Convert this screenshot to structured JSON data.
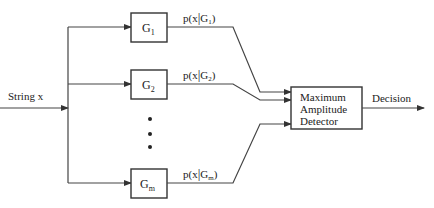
{
  "diagram": {
    "input_label": "String x",
    "output_label": "Decision",
    "detector": {
      "line1": "Maximum",
      "line2": "Amplitude",
      "line3": "Detector"
    },
    "classifiers": [
      {
        "name": "G",
        "sub": "1",
        "out_prefix": "p(x",
        "out_bar": "|",
        "out_name": "G",
        "out_sub": "1",
        "out_suffix": ")"
      },
      {
        "name": "G",
        "sub": "2",
        "out_prefix": "p(x",
        "out_bar": "|",
        "out_name": "G",
        "out_sub": "2",
        "out_suffix": ")"
      },
      {
        "name": "G",
        "sub": "m",
        "out_prefix": "p(x",
        "out_bar": "|",
        "out_name": "G",
        "out_sub": "m",
        "out_suffix": ")"
      }
    ],
    "ellipsis": "⋮",
    "colors": {
      "line": "#444444",
      "text": "#222222",
      "background": "#ffffff"
    }
  }
}
